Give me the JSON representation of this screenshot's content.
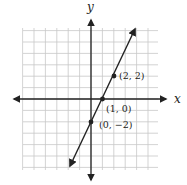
{
  "chart_data": {
    "type": "line",
    "title": "",
    "xlabel": "x",
    "ylabel": "y",
    "grid": true,
    "xlim": [
      -6,
      6
    ],
    "ylim": [
      -6,
      6
    ],
    "series": [
      {
        "name": "y = 2x - 2",
        "x": [
          -1.9,
          3.9
        ],
        "values": [
          -5.8,
          5.8
        ]
      }
    ],
    "points": [
      {
        "x": 2,
        "y": 2,
        "label": "(2, 2)"
      },
      {
        "x": 1,
        "y": 0,
        "label": "(1, 0)"
      },
      {
        "x": 0,
        "y": -2,
        "label": "(0, −2)"
      }
    ]
  },
  "axes": {
    "x_label": "x",
    "y_label": "y"
  },
  "labels": {
    "p1": "(2, 2)",
    "p2": "(1, 0)",
    "p3": "(0, −2)"
  },
  "colors": {
    "grid": "#c8c8c8",
    "axis": "#222222",
    "line": "#222222"
  }
}
